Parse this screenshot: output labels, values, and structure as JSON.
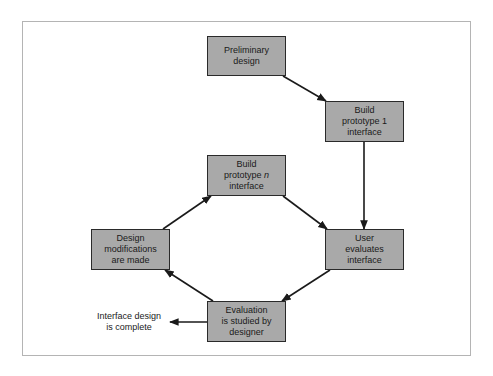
{
  "diagram": {
    "type": "flowchart",
    "colors": {
      "node_fill": "#a9a9a9",
      "node_border": "#2a2a2a",
      "edge": "#1a1a1a",
      "frame_border": "#b4b4b4"
    },
    "nodes": {
      "preliminary": {
        "line1": "Preliminary",
        "line2": "design"
      },
      "prototype1": {
        "line1": "Build",
        "line2": "prototype 1",
        "line3": "interface"
      },
      "prototypeN": {
        "line1": "Build",
        "line2_prefix": "prototype ",
        "line2_italic": "n",
        "line3": "interface"
      },
      "modifications": {
        "line1": "Design",
        "line2": "modifications",
        "line3": "are made"
      },
      "userEvaluates": {
        "line1": "User",
        "line2": "evaluates",
        "line3": "interface"
      },
      "evaluation": {
        "line1": "Evaluation",
        "line2": "is studied by",
        "line3": "designer"
      }
    },
    "terminal": {
      "line1": "Interface design",
      "line2": "is complete"
    },
    "edges": [
      {
        "from": "Preliminary design",
        "to": "Build prototype 1 interface"
      },
      {
        "from": "Build prototype 1 interface",
        "to": "User evaluates interface"
      },
      {
        "from": "User evaluates interface",
        "to": "Evaluation is studied by designer"
      },
      {
        "from": "Evaluation is studied by designer",
        "to": "Design modifications are made"
      },
      {
        "from": "Evaluation is studied by designer",
        "to": "Interface design is complete"
      },
      {
        "from": "Design modifications are made",
        "to": "Build prototype n interface"
      },
      {
        "from": "Build prototype n interface",
        "to": "User evaluates interface"
      }
    ]
  }
}
